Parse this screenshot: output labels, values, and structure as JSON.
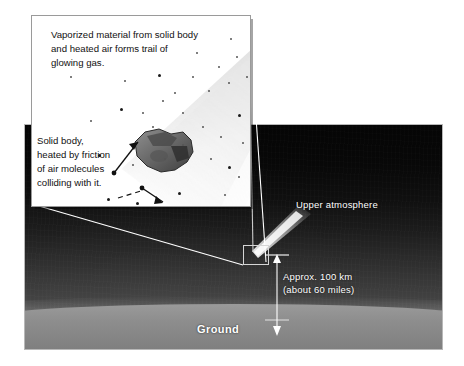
{
  "diagram": {
    "type": "cross-section illustration with magnified inset"
  },
  "inset": {
    "caption_top": "Vaporized material from solid body\nand heated air forms trail of\nglowing gas.",
    "caption_left": "Solid body,\nheated by friction\nof air molecules\ncolliding with it.",
    "body_label": "solid-body",
    "trail_label": "glowing-gas-trail"
  },
  "scene": {
    "upper_atmosphere_label": "Upper atmosphere",
    "altitude_label": "Approx. 100 km\n(about 60 miles)",
    "ground_label": "Ground",
    "altitude_km": 100,
    "altitude_miles": 60
  },
  "colors": {
    "sky_top": "#050505",
    "sky_bottom": "#5e5e5e",
    "ground": "#8e8e8e",
    "label_text": "#ffffff",
    "caption_text": "#111111",
    "inset_background": "#ffffff",
    "connector_line": "#ffffff",
    "callout_border": "#d6d6d6"
  }
}
